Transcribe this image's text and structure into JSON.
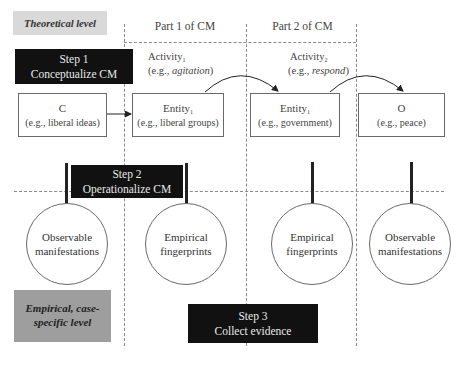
{
  "levels": {
    "theoretical": "Theoretical level",
    "empirical_line1": "Empirical, case-",
    "empirical_line2": "specific level"
  },
  "parts": {
    "part1": "Part 1 of  CM",
    "part2": "Part 2 of  CM"
  },
  "steps": {
    "step1": {
      "title": "Step 1",
      "subtitle": "Conceptualize CM"
    },
    "step2": {
      "title": "Step 2",
      "subtitle": "Operationalize CM"
    },
    "step3": {
      "title": "Step 3",
      "subtitle": "Collect evidence"
    }
  },
  "activities": {
    "activity1": {
      "label": "Activity",
      "sub": "1",
      "example_prefix": "(e.g., ",
      "example": "agitation",
      "example_suffix": ")"
    },
    "activity2": {
      "label": "Activity",
      "sub": "2",
      "example_prefix": "(e.g., ",
      "example": "respond",
      "example_suffix": ")"
    }
  },
  "nodes": {
    "cause": {
      "label": "C",
      "example": "(e.g., liberal ideas)"
    },
    "entity1": {
      "label": "Entity",
      "sub": "1",
      "example": "(e.g., liberal groups)"
    },
    "entity2": {
      "label": "Entity",
      "sub": "1",
      "example": "(e.g., government)"
    },
    "outcome": {
      "label": "O",
      "example": "(e.g., peace)"
    }
  },
  "circles": [
    {
      "line1": "Observable",
      "line2": "manifestations"
    },
    {
      "line1": "Empirical",
      "line2": "fingerprints"
    },
    {
      "line1": "Empirical",
      "line2": "fingerprints"
    },
    {
      "line1": "Observable",
      "line2": "manifestations"
    }
  ],
  "colors": {
    "step_bg": "#111111",
    "theoretical_bg": "#d9d9d9",
    "empirical_bg": "#9e9e9e"
  }
}
